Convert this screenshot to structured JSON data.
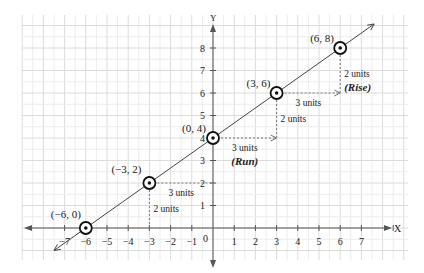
{
  "chart_data": {
    "type": "line",
    "title": "",
    "xlabel": "X",
    "ylabel": "Y",
    "xlim": [
      -8,
      8
    ],
    "ylim": [
      -1,
      9
    ],
    "grid": true,
    "x_ticks": [
      -7,
      -6,
      -5,
      -4,
      -3,
      -2,
      -1,
      1,
      2,
      3,
      4,
      5,
      6,
      7
    ],
    "x_tick_labels": [
      "−7",
      "−6",
      "−5",
      "−4",
      "−3",
      "−2",
      "−1",
      "1",
      "2",
      "3",
      "4",
      "5",
      "6",
      "7"
    ],
    "y_ticks": [
      1,
      2,
      3,
      4,
      5,
      6,
      7,
      8
    ],
    "origin_label": "0",
    "series": [
      {
        "name": "line",
        "points": [
          {
            "x": -6,
            "y": 0,
            "label": "(−6, 0)"
          },
          {
            "x": -3,
            "y": 2,
            "label": "(−3, 2)"
          },
          {
            "x": 0,
            "y": 4,
            "label": "(0, 4)"
          },
          {
            "x": 3,
            "y": 6,
            "label": "(3, 6)"
          },
          {
            "x": 6,
            "y": 8,
            "label": "(6, 8)"
          }
        ]
      }
    ],
    "annotations": [
      {
        "type": "run",
        "from": [
          -3,
          2
        ],
        "to": [
          0,
          2
        ],
        "text": "3 units"
      },
      {
        "type": "rise",
        "from": [
          -3,
          0
        ],
        "to": [
          -3,
          2
        ],
        "text": "2 units"
      },
      {
        "type": "run",
        "from": [
          0,
          4
        ],
        "to": [
          3,
          4
        ],
        "text": "3 units",
        "subtext": "(Run)"
      },
      {
        "type": "rise",
        "from": [
          3,
          4
        ],
        "to": [
          3,
          6
        ],
        "text": "2 units"
      },
      {
        "type": "run",
        "from": [
          3,
          6
        ],
        "to": [
          6,
          6
        ],
        "text": "3 units"
      },
      {
        "type": "rise",
        "from": [
          6,
          6
        ],
        "to": [
          6,
          8
        ],
        "text": "2 units",
        "subtext": "(Rise)"
      }
    ],
    "colors": {
      "line": "#444444",
      "axis": "#555555",
      "grid_minor": "#ececec",
      "grid_major": "#dcdcdc",
      "guide": "#777777"
    }
  }
}
